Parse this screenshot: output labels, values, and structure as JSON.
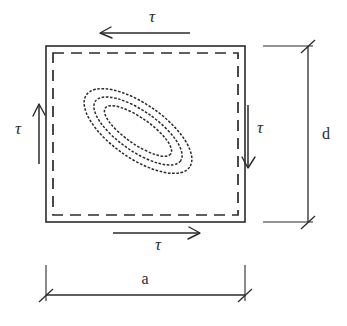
{
  "diagram": {
    "type": "engineering-cross-section",
    "colors": {
      "line": "#2b2b2b",
      "background": "#ffffff"
    },
    "section_box": {
      "outer": {
        "x": 46,
        "y": 46,
        "width": 199,
        "height": 176
      },
      "inner_dashed": {
        "x": 53,
        "y": 53,
        "width": 185,
        "height": 162
      },
      "outer_style": "solid",
      "inner_style": "dashed"
    },
    "contours": {
      "name": "stress-contour-ellipses",
      "count": 3,
      "center": {
        "x": 138,
        "y": 131
      },
      "rotation_deg": 35,
      "ellipses": [
        {
          "rx": 63,
          "ry": 27
        },
        {
          "rx": 52,
          "ry": 20
        },
        {
          "rx": 40,
          "ry": 13
        }
      ]
    },
    "shear_arrows": [
      {
        "name": "shear-arrow-top",
        "label": "τ",
        "direction": "left",
        "orientation": "horizontal",
        "line": {
          "x1": 100,
          "y1": 33,
          "x2": 190,
          "y2": 33
        },
        "label_pos": {
          "x": 152,
          "y": 22
        }
      },
      {
        "name": "shear-arrow-bottom",
        "label": "τ",
        "direction": "right",
        "orientation": "horizontal",
        "line": {
          "x1": 113,
          "y1": 233,
          "x2": 200,
          "y2": 233
        },
        "label_pos": {
          "x": 158,
          "y": 250
        }
      },
      {
        "name": "shear-arrow-left",
        "label": "τ",
        "direction": "up",
        "orientation": "vertical",
        "line": {
          "x1": 39,
          "y1": 164,
          "x2": 39,
          "y2": 104
        },
        "label_pos": {
          "x": 18,
          "y": 134
        }
      },
      {
        "name": "shear-arrow-right",
        "label": "τ",
        "direction": "down",
        "orientation": "vertical",
        "line": {
          "x1": 248,
          "y1": 105,
          "x2": 248,
          "y2": 168
        },
        "label_pos": {
          "x": 258,
          "y": 133
        }
      }
    ],
    "dimensions": [
      {
        "name": "dimension-width-a",
        "label": "a",
        "orientation": "horizontal",
        "line": {
          "x1": 46,
          "y1": 295,
          "x2": 245,
          "y2": 295
        },
        "extension_lines": [
          {
            "x1": 46,
            "y1": 265,
            "x2": 46,
            "y2": 300
          },
          {
            "x1": 245,
            "y1": 265,
            "x2": 245,
            "y2": 300
          }
        ],
        "tick_style": "slash",
        "label_pos": {
          "x": 145,
          "y": 283
        }
      },
      {
        "name": "dimension-height-d",
        "label": "d",
        "orientation": "vertical",
        "line": {
          "x1": 308,
          "y1": 46,
          "x2": 308,
          "y2": 222
        },
        "extension_lines": [
          {
            "x1": 263,
            "y1": 46,
            "x2": 313,
            "y2": 46
          },
          {
            "x1": 263,
            "y1": 222,
            "x2": 313,
            "y2": 222
          }
        ],
        "tick_style": "slash",
        "label_pos": {
          "x": 325,
          "y": 138
        }
      }
    ]
  }
}
